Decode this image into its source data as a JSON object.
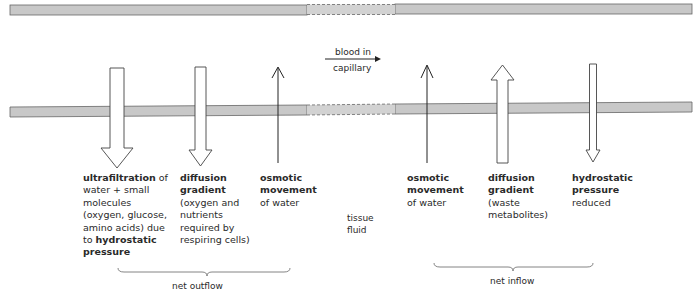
{
  "diagram": {
    "top_caption": "arteriole end",
    "flow_label": {
      "line1": "blood in",
      "line2": "capillary"
    },
    "tissue_fluid": {
      "line1": "tissue",
      "line2": "fluid"
    },
    "outflow_labels": [
      {
        "bold": "ultrafiltration",
        "rest1": " of",
        "line2": "water + small",
        "line3": "molecules",
        "line4": "(oxygen, glucose,",
        "line5": "amino acids) due",
        "line6_plain": "to ",
        "line6_bold": "hydrostatic",
        "line7_bold": "pressure"
      },
      {
        "bold1": "diffusion",
        "bold2": "gradient",
        "line3": "(oxygen and",
        "line4": "nutrients",
        "line5": "required by",
        "line6": "respiring cells)"
      },
      {
        "bold1": "osmotic",
        "bold2": "movement",
        "line3": "of water"
      }
    ],
    "inflow_labels": [
      {
        "bold1": "osmotic",
        "bold2": "movement",
        "line3": "of water"
      },
      {
        "bold1": "diffusion",
        "bold2": "gradient",
        "line3": "(waste",
        "line4": "metabolites)"
      },
      {
        "bold1": "hydrostatic",
        "bold2": "pressure",
        "line3": "reduced"
      }
    ],
    "brace_labels": {
      "left": "net outflow",
      "right": "net inflow"
    },
    "colors": {
      "capillary_wall": "#c8c8c8",
      "outline": "#555555",
      "text": "#2a2a2a"
    }
  }
}
